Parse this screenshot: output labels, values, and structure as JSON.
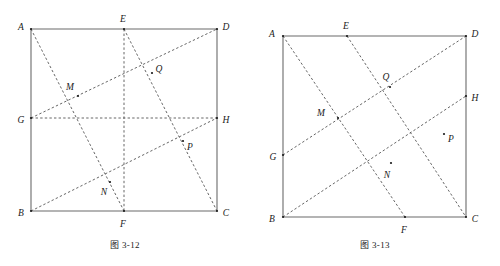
{
  "page": {
    "background_color": "#ffffff",
    "ink_color": "#1a1a1a",
    "solid_stroke_color": "#6b6b6b",
    "dashed_stroke_color": "#555555"
  },
  "figures": [
    {
      "id": "figure-3-12",
      "caption": "图 3-12",
      "frame": {
        "shape": "rectangle",
        "vertices": [
          "A",
          "B",
          "C",
          "D"
        ]
      },
      "points": [
        {
          "name": "A",
          "label": "A",
          "x": 31,
          "y": 29,
          "label_x": 21,
          "label_y": 28,
          "on": "corner-top-left"
        },
        {
          "name": "B",
          "label": "B",
          "x": 31,
          "y": 211,
          "label_x": 21,
          "label_y": 214,
          "on": "corner-bottom-left"
        },
        {
          "name": "C",
          "label": "C",
          "x": 217,
          "y": 211,
          "label_x": 226,
          "label_y": 214,
          "on": "corner-bottom-right"
        },
        {
          "name": "D",
          "label": "D",
          "x": 217,
          "y": 29,
          "label_x": 226,
          "label_y": 28,
          "on": "corner-top-right"
        },
        {
          "name": "E",
          "label": "E",
          "x": 124,
          "y": 29,
          "label_x": 123,
          "label_y": 20,
          "on": "side-AD"
        },
        {
          "name": "F",
          "label": "F",
          "x": 124,
          "y": 211,
          "label_x": 123,
          "label_y": 225,
          "on": "side-BC"
        },
        {
          "name": "G",
          "label": "G",
          "x": 31,
          "y": 118,
          "label_x": 21,
          "label_y": 121,
          "on": "side-AB"
        },
        {
          "name": "H",
          "label": "H",
          "x": 217,
          "y": 118,
          "label_x": 226,
          "label_y": 121,
          "on": "side-DC"
        },
        {
          "name": "M",
          "label": "M",
          "x": 78,
          "y": 96,
          "label_x": 70,
          "label_y": 88,
          "on": "intersection-AF-GD"
        },
        {
          "name": "N",
          "label": "N",
          "x": 110,
          "y": 182,
          "label_x": 104,
          "label_y": 193,
          "on": "intersection-AF-BH"
        },
        {
          "name": "P",
          "label": "P",
          "x": 183,
          "y": 141,
          "label_x": 190,
          "label_y": 148,
          "on": "intersection-EC-BH"
        },
        {
          "name": "Q",
          "label": "Q",
          "x": 152,
          "y": 73,
          "label_x": 159,
          "label_y": 70,
          "on": "intersection-EC-GD"
        }
      ],
      "solid_edges": [
        {
          "name": "edge-AD",
          "from": "A",
          "to": "D"
        },
        {
          "name": "edge-AB",
          "from": "A",
          "to": "B"
        },
        {
          "name": "edge-BC",
          "from": "B",
          "to": "C"
        },
        {
          "name": "edge-DC",
          "from": "D",
          "to": "C"
        }
      ],
      "dashed_lines": [
        {
          "name": "line-AF",
          "from": "A",
          "to": "F"
        },
        {
          "name": "line-EC",
          "from": "E",
          "to": "C"
        },
        {
          "name": "line-GD",
          "from": "G",
          "to": "D"
        },
        {
          "name": "line-BH",
          "from": "B",
          "to": "H"
        },
        {
          "name": "line-EF",
          "from": "E",
          "to": "F"
        },
        {
          "name": "line-GH",
          "from": "G",
          "to": "H"
        }
      ]
    },
    {
      "id": "figure-3-13",
      "caption": "图 3-13",
      "frame": {
        "shape": "rectangle",
        "vertices": [
          "A",
          "B",
          "C",
          "D"
        ]
      },
      "points": [
        {
          "name": "A",
          "label": "A",
          "x": 33,
          "y": 36,
          "label_x": 22,
          "label_y": 35,
          "on": "corner-top-left"
        },
        {
          "name": "B",
          "label": "B",
          "x": 33,
          "y": 217,
          "label_x": 22,
          "label_y": 220,
          "on": "corner-bottom-left"
        },
        {
          "name": "C",
          "label": "C",
          "x": 216,
          "y": 217,
          "label_x": 225,
          "label_y": 220,
          "on": "corner-bottom-right"
        },
        {
          "name": "D",
          "label": "D",
          "x": 216,
          "y": 36,
          "label_x": 225,
          "label_y": 35,
          "on": "corner-top-right"
        },
        {
          "name": "E",
          "label": "E",
          "x": 97,
          "y": 36,
          "label_x": 96,
          "label_y": 27,
          "on": "side-AD"
        },
        {
          "name": "F",
          "label": "F",
          "x": 155,
          "y": 217,
          "label_x": 154,
          "label_y": 231,
          "on": "side-BC"
        },
        {
          "name": "G",
          "label": "G",
          "x": 33,
          "y": 155,
          "label_x": 23,
          "label_y": 158,
          "on": "side-AB"
        },
        {
          "name": "H",
          "label": "H",
          "x": 216,
          "y": 96,
          "label_x": 225,
          "label_y": 99,
          "on": "side-DC"
        },
        {
          "name": "M",
          "label": "M",
          "x": 88,
          "y": 118,
          "label_x": 71,
          "label_y": 114,
          "on": "intersection-AF-GD"
        },
        {
          "name": "N",
          "label": "N",
          "x": 141,
          "y": 163,
          "label_x": 137,
          "label_y": 176,
          "on": "intersection-EC-BH"
        },
        {
          "name": "P",
          "label": "P",
          "x": 194,
          "y": 134,
          "label_x": 201,
          "label_y": 140,
          "on": "intersection-GD-BH"
        },
        {
          "name": "Q",
          "label": "Q",
          "x": 140,
          "y": 87,
          "label_x": 136,
          "label_y": 78,
          "on": "intersection-AF-EC"
        }
      ],
      "solid_edges": [
        {
          "name": "edge-AD",
          "from": "A",
          "to": "D"
        },
        {
          "name": "edge-AB",
          "from": "A",
          "to": "B"
        },
        {
          "name": "edge-BC",
          "from": "B",
          "to": "C"
        },
        {
          "name": "edge-DC",
          "from": "D",
          "to": "C"
        }
      ],
      "dashed_lines": [
        {
          "name": "line-AF",
          "from": "A",
          "to": "F"
        },
        {
          "name": "line-EC",
          "from": "E",
          "to": "C"
        },
        {
          "name": "line-GD",
          "from": "G",
          "to": "D"
        },
        {
          "name": "line-BH",
          "from": "B",
          "to": "H"
        }
      ]
    }
  ]
}
